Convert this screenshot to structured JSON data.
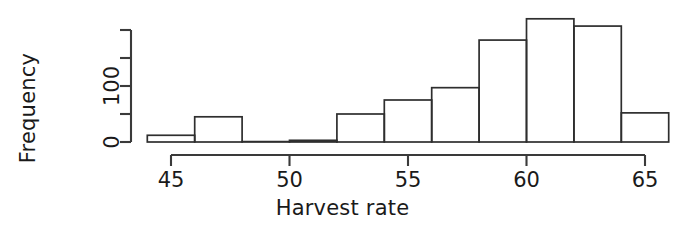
{
  "chart_data": {
    "type": "bar",
    "title": "",
    "xlabel": "Harvest rate",
    "ylabel": "Frequency",
    "xlim": [
      44,
      66
    ],
    "ylim": [
      0,
      200
    ],
    "grid": false,
    "legend": null,
    "bin_width": 2,
    "x_ticks": [
      45,
      50,
      55,
      60,
      65
    ],
    "x_tick_labels": [
      "45",
      "50",
      "55",
      "60",
      "65"
    ],
    "y_ticks": [
      0,
      50,
      100,
      150,
      200
    ],
    "y_tick_labels": [
      "0",
      "",
      "100",
      "",
      ""
    ],
    "y_tick_labels_visible": [
      "0",
      "100"
    ],
    "bins": [
      {
        "start": 44,
        "end": 46,
        "value": 12
      },
      {
        "start": 46,
        "end": 48,
        "value": 45
      },
      {
        "start": 48,
        "end": 50,
        "value": 0
      },
      {
        "start": 50,
        "end": 52,
        "value": 3
      },
      {
        "start": 52,
        "end": 54,
        "value": 50
      },
      {
        "start": 54,
        "end": 56,
        "value": 75
      },
      {
        "start": 56,
        "end": 58,
        "value": 97
      },
      {
        "start": 58,
        "end": 60,
        "value": 182
      },
      {
        "start": 60,
        "end": 62,
        "value": 220
      },
      {
        "start": 62,
        "end": 64,
        "value": 207
      },
      {
        "start": 64,
        "end": 66,
        "value": 52
      }
    ],
    "categories": [
      "44-46",
      "46-48",
      "48-50",
      "50-52",
      "52-54",
      "54-56",
      "56-58",
      "58-60",
      "60-62",
      "62-64",
      "64-66"
    ],
    "values": [
      12,
      45,
      0,
      3,
      50,
      75,
      97,
      182,
      220,
      207,
      52
    ],
    "colors": {
      "bar_stroke": "#2e2e2e",
      "bar_fill": "none",
      "axis": "#3a3a3a",
      "text": "#1a1a1a",
      "background": "#ffffff"
    }
  },
  "axes": {
    "x_title": "Harvest rate",
    "y_title": "Frequency"
  }
}
